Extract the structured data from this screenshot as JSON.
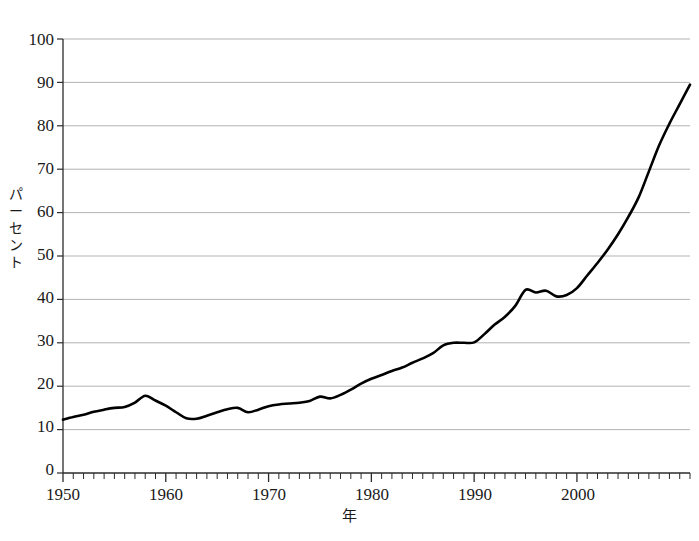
{
  "chart_data": {
    "type": "line",
    "title": "",
    "subtitle": "",
    "xlabel": "年",
    "ylabel": "パーセント",
    "ylabel_chars": [
      "パ",
      "ー",
      "セ",
      "ン",
      "ト"
    ],
    "xlim": [
      1950,
      2011
    ],
    "ylim": [
      0,
      100
    ],
    "yticks": [
      0,
      10,
      20,
      30,
      40,
      50,
      60,
      70,
      80,
      90,
      100
    ],
    "ytick_labels": [
      "0",
      "10",
      "20",
      "30",
      "40",
      "50",
      "60",
      "70",
      "80",
      "90",
      "100"
    ],
    "xticks": [
      1950,
      1960,
      1970,
      1980,
      1990,
      2000
    ],
    "xtick_labels": [
      "1950",
      "1960",
      "1970",
      "1980",
      "1990",
      "2000"
    ],
    "minor_xtick_interval": 1,
    "grid": "horizontal",
    "grid_color": "#b3b3b3",
    "line_color": "#000000",
    "line_width": 2.6,
    "legend": "none",
    "annotations": [],
    "series": [
      {
        "name": "パーセント",
        "x": [
          1950,
          1951,
          1952,
          1953,
          1954,
          1955,
          1956,
          1957,
          1958,
          1959,
          1960,
          1961,
          1962,
          1963,
          1964,
          1965,
          1966,
          1967,
          1968,
          1969,
          1970,
          1971,
          1972,
          1973,
          1974,
          1975,
          1976,
          1977,
          1978,
          1979,
          1980,
          1981,
          1982,
          1983,
          1984,
          1985,
          1986,
          1987,
          1988,
          1989,
          1990,
          1991,
          1992,
          1993,
          1994,
          1995,
          1996,
          1997,
          1998,
          1999,
          2000,
          2001,
          2002,
          2003,
          2004,
          2005,
          2006,
          2007,
          2008,
          2009,
          2010,
          2011
        ],
        "values": [
          12.3,
          12.9,
          13.4,
          14.1,
          14.6,
          15.0,
          15.2,
          16.2,
          17.8,
          16.7,
          15.5,
          14.0,
          12.6,
          12.5,
          13.2,
          14.0,
          14.7,
          15.0,
          14.0,
          14.6,
          15.4,
          15.8,
          16.0,
          16.2,
          16.6,
          17.6,
          17.2,
          18.0,
          19.2,
          20.6,
          21.7,
          22.6,
          23.5,
          24.3,
          25.4,
          26.4,
          27.6,
          29.4,
          30.0,
          30.0,
          30.1,
          32.0,
          34.2,
          36.0,
          38.5,
          42.2,
          41.6,
          42.0,
          40.7,
          41.0,
          42.6,
          45.5,
          48.4,
          51.5,
          55.0,
          59.0,
          63.5,
          69.5,
          75.5,
          80.5,
          85.0,
          89.5
        ]
      }
    ]
  }
}
